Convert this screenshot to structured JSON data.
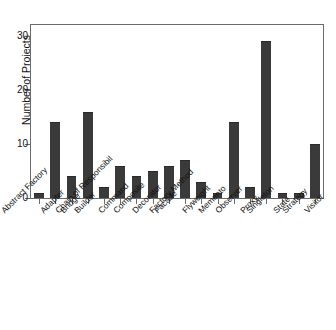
{
  "chart_data": {
    "type": "bar",
    "title": "",
    "xlabel": "",
    "ylabel": "Number of Projects",
    "ylim": [
      0,
      32
    ],
    "yticks": [
      0,
      10,
      20,
      30
    ],
    "ytick_labels": [
      "0",
      "10",
      "20",
      "30"
    ],
    "grid": false,
    "legend": "none",
    "bar_color": "#3a3a3a",
    "axis_color": "#6b6b6b",
    "categories": [
      "Abstract Factory",
      "Adapter",
      "Bridge",
      "Builder",
      "Chain of Responsibil",
      "Command",
      "Composite",
      "Decorator",
      "Facade",
      "Factory Method",
      "Flyweight",
      "Memento",
      "Observer",
      "Proxy",
      "Singleton",
      "State",
      "Strategy",
      "Visitor"
    ],
    "values": [
      1,
      14,
      4,
      16,
      2,
      6,
      4,
      5,
      6,
      7,
      3,
      1,
      14,
      2,
      29,
      1,
      1,
      10
    ]
  }
}
